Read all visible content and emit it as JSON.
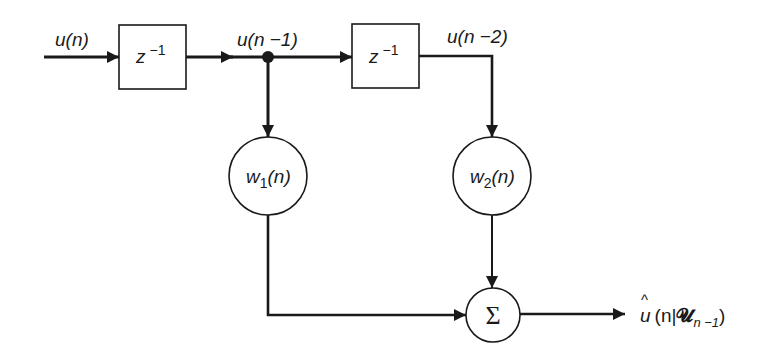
{
  "diagram": {
    "type": "block-diagram",
    "colors": {
      "stroke": "#1a1a1a",
      "background": "#ffffff"
    },
    "input": {
      "label_base": "u",
      "label_arg": "(n)"
    },
    "delay_1": {
      "label_base": "z",
      "label_exp": "−1"
    },
    "delay_2": {
      "label_base": "z",
      "label_exp": "−1"
    },
    "tap_1": {
      "label_base": "u",
      "label_arg": "(n −1)"
    },
    "tap_2": {
      "label_base": "u",
      "label_arg": "(n −2)"
    },
    "weight_1": {
      "label_base": "w",
      "label_sub": "1",
      "label_arg": "(n)"
    },
    "weight_2": {
      "label_base": "w",
      "label_sub": "2",
      "label_arg": "(n)"
    },
    "summer": {
      "label": "Σ"
    },
    "output": {
      "hat": "^",
      "label_base": "u",
      "label_open": "(n|",
      "label_vec": "𝓤",
      "label_sub": "n −1",
      "label_close": ")"
    }
  }
}
